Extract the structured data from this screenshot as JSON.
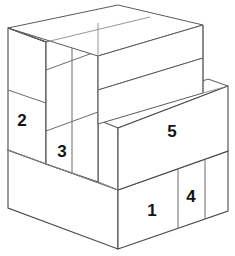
{
  "figure": {
    "type": "3d-block-diagram",
    "background_color": "#ffffff",
    "line_color": "#5a5a5a",
    "face_color": "#ffffff",
    "label_color": "#141414",
    "canvas": {
      "width": 235,
      "height": 256
    }
  },
  "labels": {
    "block1": "1",
    "block2": "2",
    "block3": "3",
    "block4": "4",
    "block5": "5"
  },
  "label_positions": {
    "block1": {
      "x": 152,
      "y": 212
    },
    "block2": {
      "x": 22,
      "y": 122
    },
    "block3": {
      "x": 62,
      "y": 153
    },
    "block4": {
      "x": 191,
      "y": 198
    },
    "block5": {
      "x": 172,
      "y": 133
    }
  }
}
